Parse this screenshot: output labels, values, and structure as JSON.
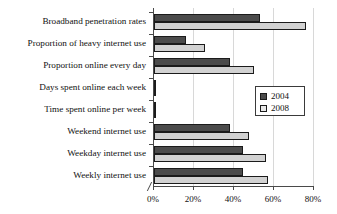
{
  "chart_data": {
    "type": "bar",
    "orientation": "horizontal",
    "title": "",
    "xlabel": "",
    "ylabel": "",
    "xlim": [
      0,
      85
    ],
    "xticks": [
      0,
      20,
      40,
      60,
      80
    ],
    "xtick_labels": [
      "0%",
      "20%",
      "40%",
      "60%",
      "80%"
    ],
    "grid": true,
    "legend_position": "right-middle",
    "categories": [
      "Broadband penetration rates",
      "Proportion of heavy internet use",
      "Proportion online every day",
      "Days spent online each week",
      "Time spent online per week",
      "Weekend internet use",
      "Weekday internet use",
      "Weekly internet use"
    ],
    "series": [
      {
        "name": "2004",
        "color": "#4b4b4b",
        "values": [
          56,
          17,
          40,
          0.5,
          0.5,
          40,
          47,
          47
        ]
      },
      {
        "name": "2008",
        "color": "#d2d2d2",
        "values": [
          80,
          27,
          53,
          0.5,
          0.5,
          50,
          59,
          60
        ]
      }
    ]
  },
  "legend": {
    "entries": [
      {
        "label": "2004"
      },
      {
        "label": "2008"
      }
    ]
  }
}
